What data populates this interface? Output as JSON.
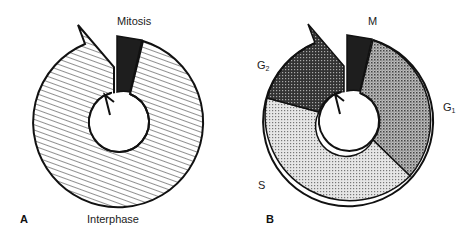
{
  "figure": {
    "panel_a": {
      "letter": "A",
      "labels": {
        "mitosis": "Mitosis",
        "interphase": "Interphase"
      },
      "segments": [
        {
          "name": "Mitosis",
          "fill": "#1e1e1e",
          "pattern": "solid"
        },
        {
          "name": "Interphase",
          "fill": "#ffffff",
          "pattern": "diagonal-hatch"
        }
      ]
    },
    "panel_b": {
      "letter": "B",
      "labels": {
        "m": "M",
        "g1_main": "G",
        "g1_sub": "1",
        "s": "S",
        "g2_main": "G",
        "g2_sub": "2"
      },
      "segments": [
        {
          "name": "M",
          "fill": "#1e1e1e",
          "pattern": "solid"
        },
        {
          "name": "G1",
          "fill": "#9a9a9a",
          "pattern": "medium-dots"
        },
        {
          "name": "S",
          "fill": "#d4d4d4",
          "pattern": "light-dots"
        },
        {
          "name": "G2",
          "fill": "#4a4a4a",
          "pattern": "dark-dots"
        }
      ]
    }
  }
}
